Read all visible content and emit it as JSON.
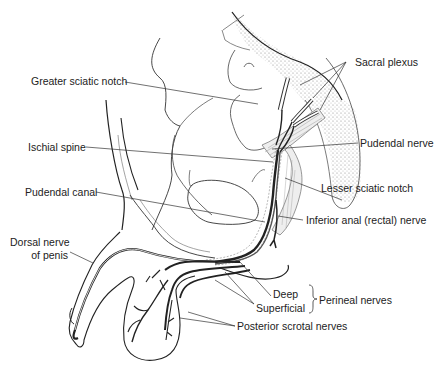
{
  "figure": {
    "type": "anatomical line drawing",
    "colors": {
      "ink": "#222222",
      "background": "#ffffff",
      "stipple": "#9a9a9a"
    }
  },
  "labels": {
    "greater_sciatic_notch": "Greater sciatic notch",
    "ischial_spine": "Ischial spine",
    "pudendal_canal": "Pudendal canal",
    "dorsal_nerve_line1": "Dorsal nerve",
    "dorsal_nerve_line2": "of penis",
    "sacral_plexus": "Sacral plexus",
    "pudendal_nerve": "Pudendal nerve",
    "lesser_sciatic_notch": "Lesser sciatic notch",
    "inferior_anal_nerve": "Inferior anal (rectal) nerve",
    "deep": "Deep",
    "superficial": "Superficial",
    "perineal_nerves": "Perineal nerves",
    "posterior_scrotal_nerves": "Posterior scrotal nerves"
  }
}
